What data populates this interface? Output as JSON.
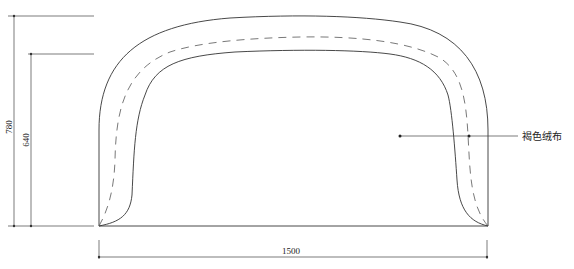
{
  "diagram": {
    "type": "technical-drawing",
    "dimensions": {
      "width_label": "1500",
      "outer_height_label": "780",
      "inner_height_label": "640"
    },
    "callout": {
      "label": "褐色绒布"
    }
  }
}
